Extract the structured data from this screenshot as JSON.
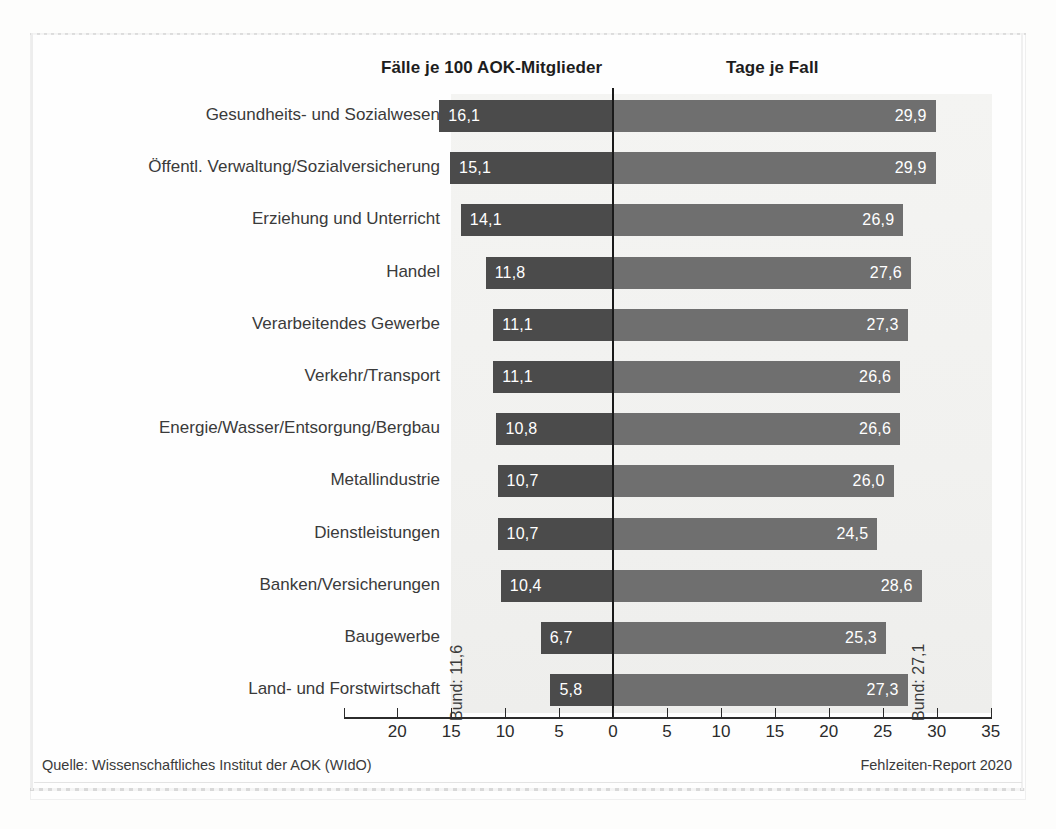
{
  "headers": {
    "left": "Fälle je 100 AOK-Mitglieder",
    "right": "Tage je Fall"
  },
  "annotations": {
    "bund_left": "Bund: 11,6",
    "bund_right": "Bund: 27,1"
  },
  "footer": {
    "source": "Quelle: Wissenschaftliches Institut der AOK (WIdO)",
    "report": "Fehlzeiten-Report 2020"
  },
  "colors": {
    "bar_left": "#4b4b4b",
    "bar_right": "#6f6f6f",
    "plot_background": "#f2f2f0",
    "axis": "#1a1a1a",
    "value_text": "#ffffff"
  },
  "chart_data": {
    "type": "bar",
    "title": "",
    "subtitle": "",
    "orientation": "horizontal-diverging",
    "xlabel": "",
    "ylabel": "",
    "grid": false,
    "legend_position": "top",
    "axis_ticks_left": [
      20,
      15,
      10,
      5,
      0
    ],
    "axis_ticks_right": [
      5,
      10,
      15,
      20,
      25,
      30,
      35
    ],
    "axis_tick_labels": [
      "20",
      "15",
      "10",
      "5",
      "0",
      "5",
      "10",
      "15",
      "20",
      "25",
      "30",
      "35"
    ],
    "xlim_left": [
      0,
      20
    ],
    "xlim_right": [
      0,
      35
    ],
    "categories": [
      "Gesundheits- und Sozialwesen",
      "Öffentl. Verwaltung/Sozialversicherung",
      "Erziehung und Unterricht",
      "Handel",
      "Verarbeitendes Gewerbe",
      "Verkehr/Transport",
      "Energie/Wasser/Entsorgung/Bergbau",
      "Metallindustrie",
      "Dienstleistungen",
      "Banken/Versicherungen",
      "Baugewerbe",
      "Land- und Forstwirtschaft"
    ],
    "series": [
      {
        "name": "Fälle je 100 AOK-Mitglieder",
        "direction": "left",
        "values": [
          16.1,
          15.1,
          14.1,
          11.8,
          11.1,
          11.1,
          10.8,
          10.7,
          10.7,
          10.4,
          6.7,
          5.8
        ],
        "labels": [
          "16,1",
          "15,1",
          "14,1",
          "11,8",
          "11,1",
          "11,1",
          "10,8",
          "10,7",
          "10,7",
          "10,4",
          "6,7",
          "5,8"
        ],
        "national_average": 11.6,
        "national_average_label": "Bund: 11,6"
      },
      {
        "name": "Tage je Fall",
        "direction": "right",
        "values": [
          29.9,
          29.9,
          26.9,
          27.6,
          27.3,
          26.6,
          26.6,
          26.0,
          24.5,
          28.6,
          25.3,
          27.3
        ],
        "labels": [
          "29,9",
          "29,9",
          "26,9",
          "27,6",
          "27,3",
          "26,6",
          "26,6",
          "26,0",
          "24,5",
          "28,6",
          "25,3",
          "27,3"
        ],
        "national_average": 27.1,
        "national_average_label": "Bund: 27,1"
      }
    ]
  }
}
